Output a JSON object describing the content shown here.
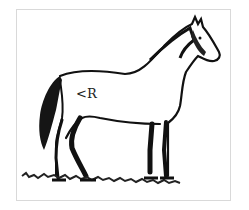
{
  "figure": {
    "brand_mark": "<R",
    "colors": {
      "ink": "#111111",
      "frame": "#d9d9d9",
      "background": "#ffffff"
    }
  }
}
